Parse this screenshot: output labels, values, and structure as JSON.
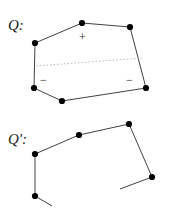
{
  "figure": {
    "width": 174,
    "height": 218,
    "background": "#ffffff",
    "stroke_color": "#2b2b2b",
    "vertex_color": "#000000",
    "dashed_color": "#b9b2b2",
    "labels": {
      "q": "Q:",
      "q_prime": "Q':"
    },
    "signs": {
      "plus": "+",
      "minus_left": "−",
      "minus_right": "−"
    }
  },
  "chart_data": {
    "type": "diagram",
    "title": "",
    "xlabel": "",
    "ylabel": "",
    "shapes": [
      {
        "name": "Q",
        "label": "Q:",
        "label_pos": [
          8,
          18
        ],
        "closed": true,
        "vertices": [
          [
            35,
            43
          ],
          [
            82,
            23
          ],
          [
            130,
            27
          ],
          [
            146,
            88
          ],
          [
            62,
            101
          ],
          [
            34,
            88
          ]
        ],
        "annotations": [
          {
            "text": "+",
            "pos": [
              79,
              31
            ]
          },
          {
            "text": "−",
            "pos": [
              40,
              74
            ]
          },
          {
            "text": "−",
            "pos": [
              126,
              74
            ]
          }
        ],
        "chords": [
          {
            "from": [
              36,
              66
            ],
            "to": [
              142,
              58
            ],
            "style": "dashed"
          }
        ]
      },
      {
        "name": "Q'",
        "label": "Q':",
        "label_pos": [
          8,
          132
        ],
        "closed": false,
        "vertices": [
          [
            35,
            154
          ],
          [
            79,
            135
          ],
          [
            129,
            124
          ],
          [
            152,
            177
          ]
        ],
        "stubs": [
          {
            "from": [
              35,
              154
            ],
            "to": [
              35,
              196
            ]
          },
          {
            "from": [
              35,
              196
            ],
            "to": [
              52,
              206
            ]
          },
          {
            "from": [
              152,
              177
            ],
            "to": [
              120,
              189
            ]
          }
        ],
        "extra_vertices": [
          [
            35,
            196
          ]
        ]
      }
    ]
  }
}
